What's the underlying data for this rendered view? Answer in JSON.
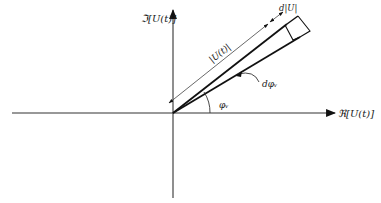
{
  "diagram": {
    "type": "phasor-diagram",
    "axes": {
      "imaginary_label": "ℑ[U(t)]",
      "real_label": "ℜ[U(t)]"
    },
    "labels": {
      "magnitude": "|U(t)|",
      "magnitude_increment": "d|U|",
      "angle": "φᵥ",
      "angle_increment": "dφᵥ"
    },
    "colors": {
      "line": "#111111",
      "thin_line": "#444444",
      "background": "#ffffff"
    }
  }
}
